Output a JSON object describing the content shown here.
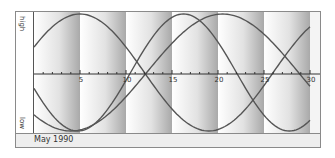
{
  "chart_data": {
    "type": "line",
    "title": "",
    "subtitle": "May 1990",
    "xlabel": "",
    "ylabel_top": "high",
    "ylabel_bottom": "low",
    "x_ticks": [
      5,
      10,
      15,
      20,
      25,
      30
    ],
    "xlim": [
      0,
      30
    ],
    "ylim": [
      -1,
      1
    ],
    "grid": false,
    "legend": null,
    "x": [
      0,
      1,
      2,
      3,
      4,
      5,
      6,
      7,
      8,
      9,
      10,
      11,
      12,
      13,
      14,
      15,
      16,
      17,
      18,
      19,
      20,
      21,
      22,
      23,
      24,
      25,
      26,
      27,
      28,
      29,
      30
    ],
    "series": [
      {
        "name": "curve-28-day",
        "period": 28,
        "peak_day": 5,
        "values": [
          0.43,
          0.62,
          0.78,
          0.9,
          0.97,
          1.0,
          0.97,
          0.9,
          0.78,
          0.62,
          0.43,
          0.22,
          0.0,
          -0.22,
          -0.43,
          -0.62,
          -0.78,
          -0.9,
          -0.97,
          -1.0,
          -0.97,
          -0.9,
          -0.78,
          -0.62,
          -0.43,
          -0.22,
          0.0,
          0.22,
          0.43,
          0.62,
          0.78
        ]
      },
      {
        "name": "curve-33-day",
        "period": 33,
        "trough_day": 4,
        "values": [
          -0.82,
          -0.9,
          -0.96,
          -0.99,
          -1.0,
          -0.99,
          -0.96,
          -0.9,
          -0.82,
          -0.72,
          -0.61,
          -0.48,
          -0.33,
          -0.19,
          -0.03,
          0.13,
          0.28,
          0.43,
          0.56,
          0.68,
          0.79,
          0.88,
          0.94,
          0.98,
          1.0,
          0.99,
          0.96,
          0.91,
          0.84,
          0.74,
          0.63
        ]
      },
      {
        "name": "curve-23-day",
        "period": 23,
        "trough_day": 4.75,
        "values": [
          -0.4,
          -0.65,
          -0.85,
          -0.97,
          -1.0,
          -0.94,
          -0.79,
          -0.58,
          -0.31,
          -0.03,
          0.26,
          0.53,
          0.76,
          0.92,
          0.99,
          0.98,
          0.88,
          0.7,
          0.46,
          0.18,
          -0.12,
          -0.4,
          -0.65,
          -0.85,
          -0.97,
          -1.0,
          -0.94,
          -0.79,
          -0.58,
          -0.31,
          -0.03
        ]
      }
    ],
    "background_bands_days": [
      0,
      5,
      10,
      15,
      20,
      25,
      30
    ]
  },
  "labels": {
    "high": "high",
    "low": "low",
    "footer": "May 1990"
  },
  "ticks": [
    "5",
    "10",
    "15",
    "20",
    "25",
    "30"
  ]
}
